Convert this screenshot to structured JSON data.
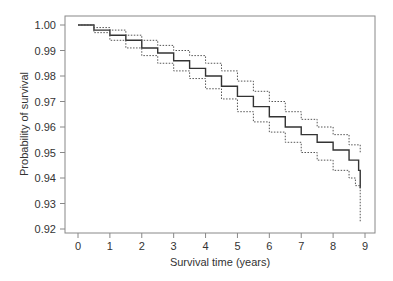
{
  "chart_data": {
    "type": "line",
    "title": "",
    "xlabel": "Survival time (years)",
    "ylabel": "Probability of survival",
    "xlim": [
      0,
      9
    ],
    "ylim": [
      0.92,
      1.0
    ],
    "xticks": [
      "0",
      "1",
      "2",
      "3",
      "4",
      "5",
      "6",
      "7",
      "8",
      "9"
    ],
    "yticks": [
      "1.00",
      "0.99",
      "0.98",
      "0.97",
      "0.96",
      "0.95",
      "0.94",
      "0.93",
      "0.92"
    ],
    "grid": false,
    "legend": null,
    "series": [
      {
        "name": "Survival estimate",
        "style": "solid",
        "x": [
          0,
          0.5,
          1,
          1.5,
          2,
          2.5,
          3,
          3.5,
          4,
          4.5,
          5,
          5.5,
          6,
          6.5,
          7,
          7.5,
          8,
          8.5,
          8.8,
          8.85
        ],
        "values": [
          1.0,
          0.998,
          0.996,
          0.994,
          0.991,
          0.989,
          0.986,
          0.983,
          0.98,
          0.976,
          0.972,
          0.968,
          0.964,
          0.96,
          0.957,
          0.954,
          0.951,
          0.947,
          0.943,
          0.936
        ]
      },
      {
        "name": "Upper 95% CI",
        "style": "dotted",
        "x": [
          0,
          0.5,
          1,
          1.5,
          2,
          2.5,
          3,
          3.5,
          4,
          4.5,
          5,
          5.5,
          6,
          6.5,
          7,
          7.5,
          8,
          8.5,
          8.85
        ],
        "values": [
          1.0,
          0.999,
          0.998,
          0.996,
          0.994,
          0.992,
          0.99,
          0.988,
          0.985,
          0.982,
          0.978,
          0.974,
          0.97,
          0.966,
          0.963,
          0.96,
          0.957,
          0.953,
          0.95
        ]
      },
      {
        "name": "Lower 95% CI",
        "style": "dotted",
        "x": [
          0,
          0.5,
          1,
          1.5,
          2,
          2.5,
          3,
          3.5,
          4,
          4.5,
          5,
          5.5,
          6,
          6.5,
          7,
          7.5,
          8,
          8.5,
          8.7,
          8.85
        ],
        "values": [
          1.0,
          0.997,
          0.994,
          0.991,
          0.988,
          0.985,
          0.982,
          0.979,
          0.975,
          0.971,
          0.966,
          0.962,
          0.958,
          0.954,
          0.95,
          0.947,
          0.943,
          0.94,
          0.937,
          0.923
        ]
      }
    ]
  }
}
